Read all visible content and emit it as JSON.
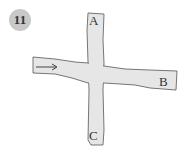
{
  "problem": {
    "number": "11"
  },
  "diagram": {
    "road_color": "#e6e6e6",
    "edge_color": "#555555",
    "labels": {
      "A": "A",
      "B": "B",
      "C": "C"
    },
    "arrow": "→"
  }
}
